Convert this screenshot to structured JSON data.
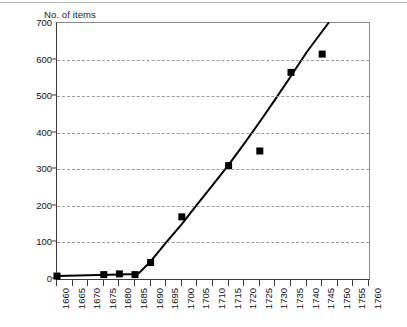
{
  "chart_data": {
    "type": "scatter",
    "title": "No. of items",
    "xlabel": "",
    "ylabel": "No. of items",
    "xlim": [
      1660,
      1760
    ],
    "ylim": [
      0,
      700
    ],
    "grid": true,
    "legend": null,
    "y_ticks": [
      0,
      100,
      200,
      300,
      400,
      500,
      600,
      700
    ],
    "y_tick_labels": [
      "0",
      "100",
      "200",
      "300",
      "400",
      "500",
      "600",
      "700"
    ],
    "x_ticks": [
      1660,
      1665,
      1670,
      1675,
      1680,
      1685,
      1690,
      1695,
      1700,
      1705,
      1710,
      1715,
      1720,
      1725,
      1730,
      1735,
      1740,
      1745,
      1750,
      1755,
      1760
    ],
    "x_tick_labels": [
      "1660",
      "1665",
      "1670",
      "1675",
      "1680",
      "1685",
      "1690",
      "1695",
      "1700",
      "1705",
      "1710",
      "1715",
      "1720",
      "1725",
      "1730",
      "1735",
      "1740",
      "1745",
      "1750",
      "1755",
      "1760"
    ],
    "marker_color": "#000000",
    "line_color": "#000000",
    "grid_color": "#9a9a9a",
    "points": [
      {
        "x": 1660,
        "y": 8
      },
      {
        "x": 1675,
        "y": 12
      },
      {
        "x": 1680,
        "y": 14
      },
      {
        "x": 1685,
        "y": 12
      },
      {
        "x": 1690,
        "y": 45
      },
      {
        "x": 1700,
        "y": 170
      },
      {
        "x": 1715,
        "y": 310
      },
      {
        "x": 1725,
        "y": 350
      },
      {
        "x": 1735,
        "y": 565
      },
      {
        "x": 1745,
        "y": 615
      }
    ],
    "trend_line": [
      {
        "x": 1660,
        "y": 8
      },
      {
        "x": 1670,
        "y": 10
      },
      {
        "x": 1680,
        "y": 12
      },
      {
        "x": 1686,
        "y": 14
      },
      {
        "x": 1690,
        "y": 48
      },
      {
        "x": 1695,
        "y": 100
      },
      {
        "x": 1700,
        "y": 150
      },
      {
        "x": 1705,
        "y": 205
      },
      {
        "x": 1710,
        "y": 258
      },
      {
        "x": 1715,
        "y": 312
      },
      {
        "x": 1720,
        "y": 370
      },
      {
        "x": 1725,
        "y": 430
      },
      {
        "x": 1730,
        "y": 492
      },
      {
        "x": 1735,
        "y": 555
      },
      {
        "x": 1740,
        "y": 620
      },
      {
        "x": 1747,
        "y": 700
      }
    ]
  }
}
